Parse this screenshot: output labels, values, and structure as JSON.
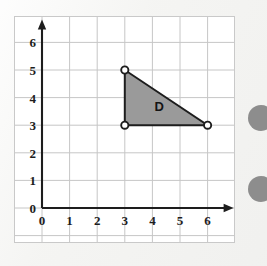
{
  "page": {
    "background_color": "#f4f4f2",
    "width": 267,
    "height": 266
  },
  "plot": {
    "name": "coordinate-grid",
    "background_color": "#ffffff",
    "border_color": "#c9c9c9",
    "gridline_color": "#c6c6c6",
    "axis_color": "#1d1d1d",
    "origin_px": {
      "x": 41,
      "y": 207
    },
    "unit_px": 27.6
  },
  "chart_data": {
    "type": "scatter",
    "title": "",
    "subtitle": "",
    "xlabel": "",
    "ylabel": "",
    "xlim": [
      0,
      6
    ],
    "ylim": [
      0,
      6
    ],
    "grid": true,
    "legend": "none",
    "x_ticks": [
      "0",
      "1",
      "2",
      "3",
      "4",
      "5",
      "6"
    ],
    "y_ticks": [
      "0",
      "1",
      "2",
      "3",
      "4",
      "5",
      "6"
    ],
    "x_tick_values": [
      0,
      1,
      2,
      3,
      4,
      5,
      6
    ],
    "y_tick_values": [
      0,
      1,
      2,
      3,
      4,
      5,
      6
    ],
    "annotations": [
      {
        "label": "D",
        "x": 4.25,
        "y": 3.7
      }
    ],
    "series": [
      {
        "name": "D",
        "shape": "triangle",
        "fill_color": "#9a9a9a",
        "stroke_color": "#1d1d1d",
        "vertex_marker": "open-circle",
        "vertices": [
          {
            "x": 3,
            "y": 5
          },
          {
            "x": 3,
            "y": 3
          },
          {
            "x": 6,
            "y": 3
          }
        ]
      }
    ]
  },
  "ticks": {
    "x": [
      {
        "label": "0",
        "value": 0
      },
      {
        "label": "1",
        "value": 1
      },
      {
        "label": "2",
        "value": 2
      },
      {
        "label": "3",
        "value": 3
      },
      {
        "label": "4",
        "value": 4
      },
      {
        "label": "5",
        "value": 5
      },
      {
        "label": "6",
        "value": 6
      }
    ],
    "y": [
      {
        "label": "0",
        "value": 0
      },
      {
        "label": "1",
        "value": 1
      },
      {
        "label": "2",
        "value": 2
      },
      {
        "label": "3",
        "value": 3
      },
      {
        "label": "4",
        "value": 4
      },
      {
        "label": "5",
        "value": 5
      },
      {
        "label": "6",
        "value": 6
      }
    ]
  },
  "shape": {
    "label": "D",
    "fill_color": "#9a9a9a",
    "stroke_color": "#1d1d1d"
  },
  "edge_markers": {
    "color": "#8d8d8d",
    "count": 2
  }
}
